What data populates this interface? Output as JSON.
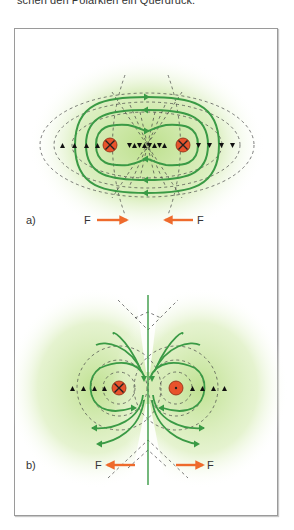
{
  "page": {
    "top_text": "schen den Polarkien ein Querdruck."
  },
  "figure": {
    "panels": [
      {
        "id": "a",
        "label": "a)",
        "force_left_label": "F",
        "force_right_label": "F",
        "conductors": [
          "into-page",
          "into-page"
        ],
        "force_direction": "attract"
      },
      {
        "id": "b",
        "label": "b)",
        "force_left_label": "F",
        "force_right_label": "F",
        "conductors": [
          "into-page",
          "out-of-page"
        ],
        "force_direction": "repel"
      }
    ],
    "colors": {
      "field_line": "#3a9a45",
      "field_glow": "#a6d67a",
      "conductor_fill": "#e8532c",
      "force_arrow": "#ee6a2c",
      "dashed": "#444444"
    }
  }
}
